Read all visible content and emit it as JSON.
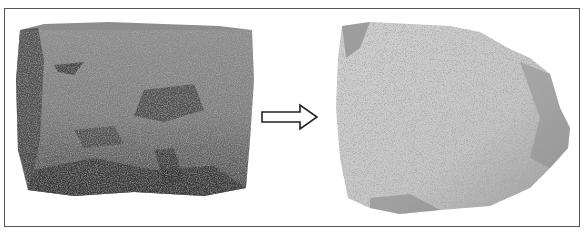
{
  "figure": {
    "frame": {
      "border_color": "#555555",
      "background": "#ffffff"
    },
    "panels": [
      {
        "id": "before",
        "subject": "rock-fresh",
        "tone": "dark gray",
        "base_color": "#7a7a7a",
        "shadow_color": "#3a3a3a",
        "highlight_color": "#a8a8a8"
      },
      {
        "id": "after",
        "subject": "rock-weathered",
        "tone": "light gray speckled",
        "base_color": "#c4c4c4",
        "shadow_color": "#6a6a6a",
        "highlight_color": "#e6e6e6"
      }
    ],
    "connector": {
      "type": "outline-arrow",
      "direction": "right",
      "stroke": "#222222",
      "fill": "#ffffff"
    }
  }
}
